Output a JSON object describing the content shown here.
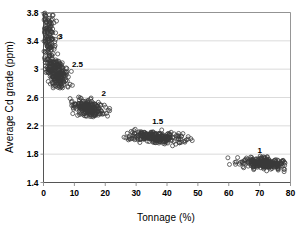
{
  "chart_data": {
    "type": "scatter",
    "title": "",
    "xlabel": "Tonnage (%)",
    "ylabel": "Average Cd  grade (ppm)",
    "xlim": [
      0,
      80
    ],
    "ylim": [
      1.4,
      3.8
    ],
    "xticks": [
      0,
      10,
      20,
      30,
      40,
      50,
      60,
      70,
      80
    ],
    "yticks": [
      1.4,
      1.8,
      2.2,
      2.6,
      3,
      3.4,
      3.8
    ],
    "xtick_labels": [
      "0",
      "10",
      "20",
      "30",
      "40",
      "50",
      "60",
      "70",
      "80"
    ],
    "ytick_labels": [
      "1.4",
      "1.8",
      "2.2",
      "2.6",
      "3",
      "3.4",
      "3.8"
    ],
    "grid": {
      "horizontal": true,
      "vertical": false,
      "color": "#cccccc"
    },
    "legend": "none",
    "marker": {
      "shape": "open-circle",
      "size": 2.0,
      "color": "#3a3a3a",
      "fill": "none"
    },
    "annotations": [
      {
        "text": "3",
        "x": 5.5,
        "y": 3.42
      },
      {
        "text": "2.5",
        "x": 11.0,
        "y": 3.03
      },
      {
        "text": "2",
        "x": 19.5,
        "y": 2.62
      },
      {
        "text": "1.5",
        "x": 37.0,
        "y": 2.22
      },
      {
        "text": "1",
        "x": 70.0,
        "y": 1.82
      }
    ],
    "series": [
      {
        "name": "cutoff 3",
        "label": "3",
        "center": [
          1.7,
          3.32
        ],
        "spread": [
          1.3,
          0.3
        ],
        "n": 230,
        "x_range": [
          0.1,
          5.2
        ],
        "y_range": [
          2.95,
          3.8
        ]
      },
      {
        "name": "cutoff 2.5",
        "label": "2.5",
        "center": [
          4.6,
          2.93
        ],
        "spread": [
          1.6,
          0.1
        ],
        "n": 230,
        "x_range": [
          1.2,
          9.5
        ],
        "y_range": [
          2.72,
          3.12
        ]
      },
      {
        "name": "cutoff 2",
        "label": "2",
        "center": [
          14.5,
          2.45
        ],
        "spread": [
          2.8,
          0.055
        ],
        "n": 240,
        "x_range": [
          8.5,
          23.0
        ],
        "y_range": [
          2.3,
          2.62
        ]
      },
      {
        "name": "cutoff 1.5",
        "label": "1.5",
        "center": [
          36.5,
          2.04
        ],
        "spread": [
          4.6,
          0.042
        ],
        "n": 260,
        "x_range": [
          26.0,
          48.5
        ],
        "y_range": [
          1.9,
          2.17
        ]
      },
      {
        "name": "cutoff 1",
        "label": "1",
        "center": [
          71.5,
          1.67
        ],
        "spread": [
          3.4,
          0.038
        ],
        "n": 250,
        "x_range": [
          54.0,
          79.5
        ],
        "y_range": [
          1.52,
          1.8
        ]
      }
    ]
  },
  "axes": {
    "frame_color": "#8a8a8a",
    "tick_color": "#8a8a8a"
  }
}
